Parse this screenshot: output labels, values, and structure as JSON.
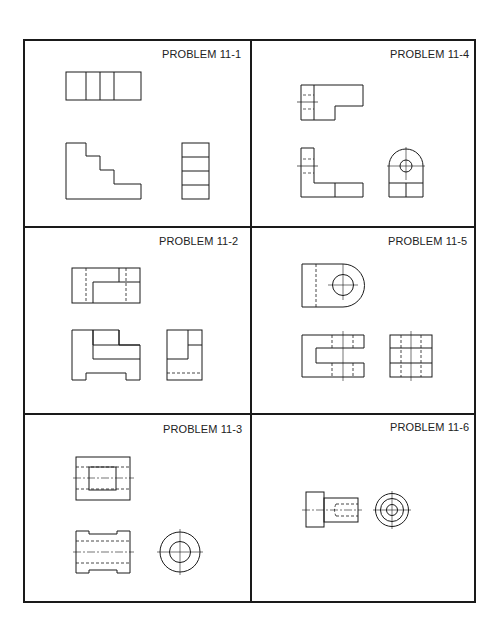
{
  "sheet": {
    "title": "Multiview drawing problems",
    "panels": [
      {
        "id": "11-1",
        "label": "PROBLEM 11-1",
        "position": "top-left"
      },
      {
        "id": "11-4",
        "label": "PROBLEM 11-4",
        "position": "top-right"
      },
      {
        "id": "11-2",
        "label": "PROBLEM 11-2",
        "position": "middle-left"
      },
      {
        "id": "11-5",
        "label": "PROBLEM 11-5",
        "position": "middle-right"
      },
      {
        "id": "11-3",
        "label": "PROBLEM 11-3",
        "position": "bottom-left"
      },
      {
        "id": "11-6",
        "label": "PROBLEM 11-6",
        "position": "bottom-right"
      }
    ],
    "line_color": "#1a1a1a",
    "background": "#ffffff"
  }
}
